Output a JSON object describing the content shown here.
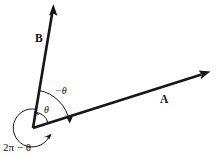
{
  "figure": {
    "type": "geometry-diagram",
    "background_color": "#ffffff",
    "stroke_color": "#161616"
  },
  "vectors": [
    {
      "id": "vector-b",
      "label": "B",
      "label_x": 35,
      "label_y": 42,
      "origin": [
        33,
        128
      ],
      "tip": [
        53,
        5
      ],
      "description": "vector B pointing up and slightly right"
    },
    {
      "id": "vector-a",
      "label": "A",
      "label_x": 160,
      "label_y": 103,
      "origin": [
        33,
        128
      ],
      "tip": [
        210,
        72
      ],
      "description": "vector A pointing right and slightly up"
    }
  ],
  "angles": [
    {
      "id": "angle-theta",
      "label": "θ",
      "label_x": 46,
      "label_y": 112,
      "radius": 16,
      "direction": "counterclockwise",
      "from": "vector-a",
      "to": "vector-b"
    },
    {
      "id": "angle-negative-theta",
      "label": "−θ",
      "label_x": 57,
      "label_y": 93,
      "radius": 38,
      "direction": "clockwise",
      "from": "vector-b",
      "to": "vector-a"
    },
    {
      "id": "angle-two-pi-minus-theta",
      "label": "2π − θ",
      "label_x": 4,
      "label_y": 150,
      "radius": 19,
      "direction": "counterclockwise-reflex",
      "from": "vector-b",
      "to": "vector-a"
    }
  ]
}
